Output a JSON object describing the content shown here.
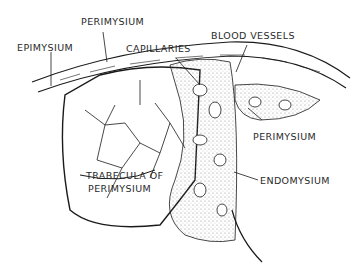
{
  "figure": {
    "labels": {
      "perimysium_top": "PERIMYSIUM",
      "epimysium": "EPIMYSIUM",
      "capillaries": "CAPILLARIES",
      "blood_vessels": "BLOOD VESSELS",
      "perimysium_right": "PERIMYSIUM",
      "trabecula_line1": "TRABECULA OF",
      "trabecula_line2": "PERIMYSIUM",
      "endomysium": "ENDOMYSIUM"
    },
    "colors": {
      "ink": "#1a1a1a",
      "background": "#ffffff",
      "stipple": "#888888"
    }
  }
}
